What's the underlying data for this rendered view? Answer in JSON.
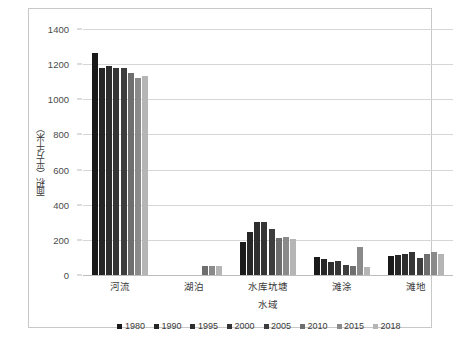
{
  "chart_data": {
    "type": "bar",
    "title": "",
    "xlabel": "水域",
    "ylabel": "面积（平方千米）",
    "ylim": [
      0,
      1400
    ],
    "ytick_step": 200,
    "yticks": [
      "1400",
      "1200",
      "1000",
      "800",
      "600",
      "400",
      "200",
      "0"
    ],
    "grid": "horizontal",
    "legend_position": "bottom",
    "categories": [
      "河流",
      "湖泊",
      "水库坑塘",
      "滩涂",
      "滩地"
    ],
    "series": [
      {
        "name": "1980",
        "color": "#1a1a1a",
        "values": [
          1265,
          0,
          190,
          100,
          108
        ]
      },
      {
        "name": "1990",
        "color": "#262626",
        "values": [
          1180,
          0,
          245,
          92,
          112
        ]
      },
      {
        "name": "1995",
        "color": "#2e2e2e",
        "values": [
          1190,
          0,
          300,
          75,
          118
        ]
      },
      {
        "name": "2000",
        "color": "#353535",
        "values": [
          1180,
          0,
          300,
          80,
          130
        ]
      },
      {
        "name": "2005",
        "color": "#3d3d3d",
        "values": [
          1180,
          0,
          262,
          55,
          95
        ]
      },
      {
        "name": "2010",
        "color": "#6e6e6e",
        "values": [
          1150,
          52,
          208,
          50,
          118
        ]
      },
      {
        "name": "2015",
        "color": "#8a8a8a",
        "values": [
          1120,
          52,
          215,
          160,
          130
        ]
      },
      {
        "name": "2018",
        "color": "#b5b5b5",
        "values": [
          1135,
          52,
          203,
          45,
          122
        ]
      }
    ]
  }
}
